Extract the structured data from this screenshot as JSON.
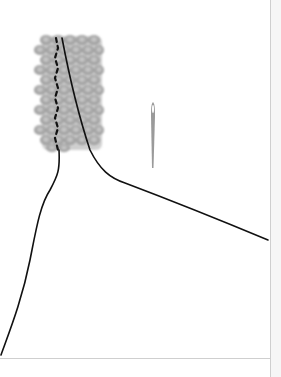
{
  "figure": {
    "elements": {
      "beadwork": {
        "label": "beaded strip",
        "color": "#9a9a9a"
      },
      "thread": {
        "label": "thread",
        "color": "#111111"
      },
      "needle": {
        "label": "needle",
        "color": "#8a8a8a"
      }
    }
  }
}
